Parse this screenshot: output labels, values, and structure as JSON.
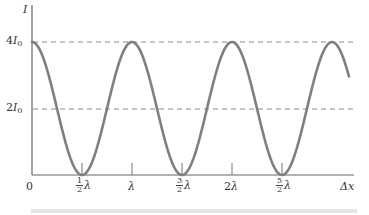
{
  "chart_data": {
    "type": "line",
    "title": "",
    "xlabel": "Δx",
    "ylabel": "I",
    "function": "I = 4 I0 cos^2(π Δx / λ)",
    "x_units": "λ",
    "x": [
      0,
      0.25,
      0.5,
      0.75,
      1.0,
      1.25,
      1.5,
      1.75,
      2.0,
      2.25,
      2.5,
      2.75,
      3.0,
      3.17
    ],
    "y": [
      4,
      2,
      0,
      2,
      4,
      2,
      0,
      2,
      4,
      2,
      0,
      2,
      4,
      3.5
    ],
    "y_units": "I0",
    "ylim": [
      0,
      4.5
    ],
    "xlim": [
      0,
      3.2
    ],
    "x_ticks": [
      {
        "value": 0,
        "label": "0"
      },
      {
        "value": 0.5,
        "label": "½λ",
        "num": "1",
        "den": "2",
        "sym": "λ"
      },
      {
        "value": 1.0,
        "label": "λ",
        "sym": "λ"
      },
      {
        "value": 1.5,
        "label": "3/2λ",
        "num": "3",
        "den": "2",
        "sym": "λ"
      },
      {
        "value": 2.0,
        "label": "2λ",
        "coef": "2",
        "sym": "λ"
      },
      {
        "value": 2.5,
        "label": "5/2λ",
        "num": "5",
        "den": "2",
        "sym": "λ"
      }
    ],
    "y_ticks": [
      {
        "value": 4,
        "label": "4I0",
        "coef": "4",
        "sym": "I",
        "sub": "0"
      },
      {
        "value": 2,
        "label": "2I0",
        "coef": "2",
        "sym": "I",
        "sub": "0"
      }
    ],
    "reference_lines": [
      {
        "y": 4,
        "style": "dashed",
        "label": "4I0"
      },
      {
        "y": 2,
        "style": "dashed",
        "label": "2I0"
      }
    ],
    "grid": false,
    "legend": null,
    "line_color": "#7f7f7f",
    "axis_color": "#666666",
    "dash_color": "#8a8a8a"
  }
}
